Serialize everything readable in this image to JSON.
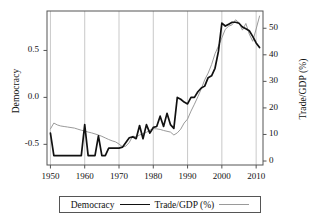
{
  "chart_data": {
    "type": "line",
    "title": "",
    "xlabel": "",
    "ylabel": "Democracy",
    "y2label": "Trade/GDP (%)",
    "xlim": [
      1949,
      2012
    ],
    "ylim": [
      -0.72,
      0.92
    ],
    "y2lim": [
      -1.5,
      56.5
    ],
    "grid": "vertical",
    "legend_position": "bottom",
    "xticks": [
      "1950",
      "1960",
      "1970",
      "1980",
      "1990",
      "2000",
      "2010"
    ],
    "xtick_values": [
      1950,
      1960,
      1970,
      1980,
      1990,
      2000,
      2010
    ],
    "yticks": [
      "0.5",
      "0.0",
      "-0.5"
    ],
    "ytick_values": [
      0.5,
      0.0,
      -0.5
    ],
    "y2ticks": [
      "50",
      "40",
      "30",
      "20",
      "10",
      "0"
    ],
    "y2tick_values": [
      50,
      40,
      30,
      20,
      10,
      0
    ],
    "series": [
      {
        "name": "Democracy",
        "axis": "left",
        "color": "#111111",
        "width": 1.7,
        "x": [
          1950,
          1951,
          1952,
          1953,
          1954,
          1955,
          1956,
          1957,
          1958,
          1959,
          1960,
          1961,
          1962,
          1963,
          1964,
          1965,
          1966,
          1967,
          1968,
          1969,
          1970,
          1971,
          1972,
          1973,
          1974,
          1975,
          1976,
          1977,
          1978,
          1979,
          1980,
          1981,
          1982,
          1983,
          1984,
          1985,
          1986,
          1987,
          1988,
          1989,
          1990,
          1991,
          1992,
          1993,
          1994,
          1995,
          1996,
          1997,
          1998,
          1999,
          2000,
          2001,
          2002,
          2003,
          2004,
          2005,
          2006,
          2007,
          2008,
          2009,
          2010,
          2011
        ],
        "values": [
          -0.38,
          -0.62,
          -0.62,
          -0.62,
          -0.62,
          -0.62,
          -0.62,
          -0.62,
          -0.62,
          -0.62,
          -0.29,
          -0.62,
          -0.62,
          -0.62,
          -0.41,
          -0.62,
          -0.62,
          -0.54,
          -0.54,
          -0.54,
          -0.54,
          -0.53,
          -0.48,
          -0.43,
          -0.42,
          -0.44,
          -0.3,
          -0.44,
          -0.29,
          -0.38,
          -0.32,
          -0.31,
          -0.2,
          -0.31,
          -0.17,
          -0.29,
          -0.33,
          0.0,
          -0.02,
          -0.05,
          -0.07,
          0.0,
          0.0,
          0.06,
          0.1,
          0.12,
          0.21,
          0.23,
          0.31,
          0.49,
          0.79,
          0.76,
          0.78,
          0.8,
          0.8,
          0.79,
          0.75,
          0.73,
          0.71,
          0.65,
          0.58,
          0.53
        ]
      },
      {
        "name": "Trade/GDP (%)",
        "axis": "right",
        "color": "#9a9a9a",
        "width": 1.0,
        "x": [
          1950,
          1951,
          1952,
          1953,
          1954,
          1955,
          1956,
          1957,
          1958,
          1959,
          1960,
          1961,
          1962,
          1963,
          1964,
          1965,
          1966,
          1967,
          1968,
          1969,
          1970,
          1971,
          1972,
          1973,
          1974,
          1975,
          1976,
          1977,
          1978,
          1979,
          1980,
          1981,
          1982,
          1983,
          1984,
          1985,
          1986,
          1987,
          1988,
          1989,
          1990,
          1991,
          1992,
          1993,
          1994,
          1995,
          1996,
          1997,
          1998,
          1999,
          2000,
          2001,
          2002,
          2003,
          2004,
          2005,
          2006,
          2007,
          2008,
          2009,
          2010,
          2011
        ],
        "values": [
          12.1,
          14.3,
          13.6,
          13.2,
          13.0,
          12.8,
          12.6,
          12.4,
          12.0,
          11.6,
          11.3,
          10.9,
          10.6,
          10.2,
          9.8,
          9.3,
          8.7,
          8.1,
          7.6,
          7.2,
          6.4,
          5.4,
          5.6,
          7.0,
          9.4,
          9.1,
          9.8,
          10.3,
          10.8,
          11.6,
          12.2,
          12.1,
          11.9,
          11.5,
          11.2,
          10.9,
          9.8,
          10.6,
          12.0,
          14.3,
          15.8,
          18.8,
          21.4,
          24.2,
          27.2,
          30.6,
          33.1,
          36.3,
          40.4,
          43.3,
          46.4,
          49.6,
          50.8,
          51.3,
          53.2,
          52.1,
          49.3,
          51.8,
          47.8,
          45.1,
          49.7,
          54.6
        ]
      }
    ]
  },
  "axes": {
    "left_title": "Democracy",
    "right_title": "Trade/GDP (%)"
  },
  "legend": {
    "items": [
      {
        "label": "Democracy",
        "style": "thick-black-line"
      },
      {
        "label": "Trade/GDP (%)",
        "style": "thin-gray-line"
      }
    ]
  },
  "colors": {
    "democracy_line": "#111111",
    "trade_line": "#9a9a9a",
    "frame": "#555555",
    "gridline": "#bbbbbb",
    "background": "#ffffff"
  }
}
